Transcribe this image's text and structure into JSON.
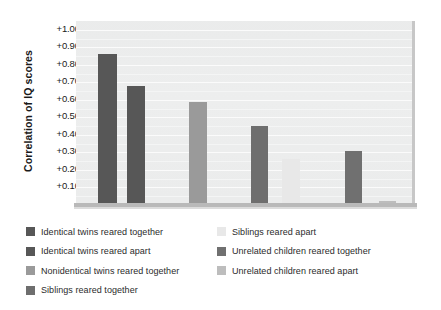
{
  "chart_data": {
    "type": "bar",
    "title": "",
    "xlabel": "",
    "ylabel": "Correlation of IQ scores",
    "ylim": [
      0.0,
      1.05
    ],
    "grid": true,
    "legend_position": "below",
    "y_ticks": [
      "+1.00",
      "+0.90",
      "+0.80",
      "+0.70",
      "+0.60",
      "+0.50",
      "+0.40",
      "+0.30",
      "+0.20",
      "+0.10"
    ],
    "y_tick_values": [
      1.0,
      0.9,
      0.8,
      0.7,
      0.6,
      0.5,
      0.4,
      0.3,
      0.2,
      0.1
    ],
    "categories": [
      "Identical twins reared together",
      "Identical twins reared apart",
      "Nonidentical twins reared together",
      "Siblings reared together",
      "Siblings reared apart",
      "Unrelated children reared together",
      "Unrelated children reared apart"
    ],
    "values": [
      0.86,
      0.68,
      0.59,
      0.45,
      0.26,
      0.31,
      0.02
    ],
    "colors": [
      "#575757",
      "#575757",
      "#9a9a9a",
      "#6e6e6e",
      "#e8e8e8",
      "#707070",
      "#bdbdbd"
    ],
    "bars": [
      {
        "label": "Identical twins reared together",
        "value": 0.86,
        "color": "#575757",
        "x": 22,
        "width": 19
      },
      {
        "label": "Identical twins reared apart",
        "value": 0.68,
        "color": "#575757",
        "x": 51,
        "width": 18
      },
      {
        "label": "Nonidentical twins reared together",
        "value": 0.59,
        "color": "#9a9a9a",
        "x": 113,
        "width": 18
      },
      {
        "label": "Siblings reared together",
        "value": 0.45,
        "color": "#6e6e6e",
        "x": 175,
        "width": 17
      },
      {
        "label": "Siblings reared apart",
        "value": 0.26,
        "color": "#e8e8e8",
        "x": 206,
        "width": 18
      },
      {
        "label": "Unrelated children reared together",
        "value": 0.31,
        "color": "#707070",
        "x": 269,
        "width": 17
      },
      {
        "label": "Unrelated children reared apart",
        "value": 0.02,
        "color": "#bdbdbd",
        "x": 303,
        "width": 17
      }
    ]
  },
  "axis": {
    "y_title": "Correlation of IQ scores"
  },
  "legend": {
    "left_column": [
      {
        "label": "Identical twins reared together",
        "color": "#575757"
      },
      {
        "label": "Identical twins reared apart",
        "color": "#575757"
      },
      {
        "label": "Nonidentical twins reared together",
        "color": "#9a9a9a"
      },
      {
        "label": "Siblings reared together",
        "color": "#6e6e6e"
      }
    ],
    "right_column": [
      {
        "label": "Siblings reared apart",
        "color": "#e8e8e8"
      },
      {
        "label": "Unrelated children reared together",
        "color": "#707070"
      },
      {
        "label": "Unrelated children reared apart",
        "color": "#bdbdbd"
      }
    ]
  }
}
